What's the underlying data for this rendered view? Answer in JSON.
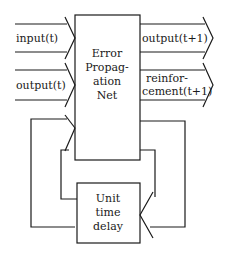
{
  "diagram": {
    "main_block": {
      "lines": [
        "Error",
        "Propag-",
        "ation",
        "Net"
      ]
    },
    "delay_block": {
      "lines": [
        "Unit",
        "time",
        "delay"
      ]
    },
    "inputs": [
      {
        "label": "input(t)"
      },
      {
        "label": "output(t)"
      }
    ],
    "outputs": [
      {
        "label": "output(t+1)"
      },
      {
        "label": "reinfor-",
        "label2": "cement(t+1)"
      }
    ],
    "colors": {
      "stroke": "#1a1a1a",
      "background": "#ffffff"
    }
  }
}
